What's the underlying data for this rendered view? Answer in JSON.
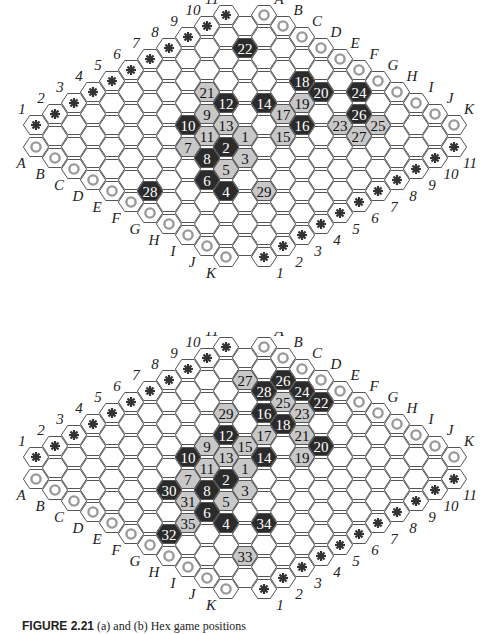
{
  "colors": {
    "dark_stone": "#2b2b2b",
    "light_stone": "#c8c8c8",
    "grid_line": "#555555",
    "circle_marker": "#999999",
    "asterisk": "#333333"
  },
  "board": {
    "size": 11,
    "letters": [
      "A",
      "B",
      "C",
      "D",
      "E",
      "F",
      "G",
      "H",
      "I",
      "J",
      "K"
    ],
    "numbers": [
      "1",
      "2",
      "3",
      "4",
      "5",
      "6",
      "7",
      "8",
      "9",
      "10",
      "11"
    ]
  },
  "boards": [
    {
      "id": "top",
      "offset_y": 0,
      "stones": [
        {
          "n": "1",
          "cell": "F6",
          "color": "light"
        },
        {
          "n": "2",
          "cell": "F5",
          "color": "dark"
        },
        {
          "n": "3",
          "cell": "G5",
          "color": "light"
        },
        {
          "n": "4",
          "cell": "H3",
          "color": "dark"
        },
        {
          "n": "5",
          "cell": "G4",
          "color": "light"
        },
        {
          "n": "6",
          "cell": "G3",
          "color": "dark"
        },
        {
          "n": "7",
          "cell": "E4",
          "color": "light"
        },
        {
          "n": "8",
          "cell": "F4",
          "color": "dark"
        },
        {
          "n": "9",
          "cell": "D6",
          "color": "light"
        },
        {
          "n": "10",
          "cell": "D5",
          "color": "dark"
        },
        {
          "n": "11",
          "cell": "E5",
          "color": "light"
        },
        {
          "n": "12",
          "cell": "D7",
          "color": "dark"
        },
        {
          "n": "13",
          "cell": "E6",
          "color": "light"
        },
        {
          "n": "14",
          "cell": "E8",
          "color": "dark"
        },
        {
          "n": "15",
          "cell": "G7",
          "color": "light"
        },
        {
          "n": "16",
          "cell": "G8",
          "color": "dark"
        },
        {
          "n": "17",
          "cell": "F8",
          "color": "light"
        },
        {
          "n": "18",
          "cell": "E10",
          "color": "dark"
        },
        {
          "n": "19",
          "cell": "F9",
          "color": "light"
        },
        {
          "n": "20",
          "cell": "F10",
          "color": "dark"
        },
        {
          "n": "21",
          "cell": "C7",
          "color": "light"
        },
        {
          "n": "22",
          "cell": "B10",
          "color": "dark"
        },
        {
          "n": "23",
          "cell": "H9",
          "color": "light"
        },
        {
          "n": "24",
          "cell": "G11",
          "color": "dark"
        },
        {
          "n": "25",
          "cell": "I10",
          "color": "light"
        },
        {
          "n": "26",
          "cell": "H10",
          "color": "dark"
        },
        {
          "n": "27",
          "cell": "I9",
          "color": "light"
        },
        {
          "n": "28",
          "cell": "F1",
          "color": "dark"
        },
        {
          "n": "29",
          "cell": "I4",
          "color": "light"
        }
      ]
    },
    {
      "id": "bottom",
      "offset_y": 332,
      "stones": [
        {
          "n": "1",
          "cell": "F6",
          "color": "light"
        },
        {
          "n": "2",
          "cell": "F5",
          "color": "dark"
        },
        {
          "n": "3",
          "cell": "G5",
          "color": "light"
        },
        {
          "n": "4",
          "cell": "H3",
          "color": "dark"
        },
        {
          "n": "5",
          "cell": "G4",
          "color": "light"
        },
        {
          "n": "6",
          "cell": "G3",
          "color": "dark"
        },
        {
          "n": "7",
          "cell": "E4",
          "color": "light"
        },
        {
          "n": "8",
          "cell": "F4",
          "color": "dark"
        },
        {
          "n": "9",
          "cell": "D6",
          "color": "light"
        },
        {
          "n": "10",
          "cell": "D5",
          "color": "dark"
        },
        {
          "n": "11",
          "cell": "E5",
          "color": "light"
        },
        {
          "n": "12",
          "cell": "D7",
          "color": "dark"
        },
        {
          "n": "13",
          "cell": "E6",
          "color": "light"
        },
        {
          "n": "14",
          "cell": "F7",
          "color": "dark"
        },
        {
          "n": "15",
          "cell": "E7",
          "color": "light"
        },
        {
          "n": "16",
          "cell": "D9",
          "color": "dark"
        },
        {
          "n": "17",
          "cell": "E8",
          "color": "light"
        },
        {
          "n": "18",
          "cell": "E9",
          "color": "dark"
        },
        {
          "n": "19",
          "cell": "G8",
          "color": "light"
        },
        {
          "n": "20",
          "cell": "G9",
          "color": "dark"
        },
        {
          "n": "21",
          "cell": "F9",
          "color": "light"
        },
        {
          "n": "22",
          "cell": "E11",
          "color": "dark"
        },
        {
          "n": "23",
          "cell": "E10",
          "color": "light"
        },
        {
          "n": "24",
          "cell": "D11",
          "color": "dark"
        },
        {
          "n": "25",
          "cell": "D10",
          "color": "light"
        },
        {
          "n": "26",
          "cell": "C11",
          "color": "dark"
        },
        {
          "n": "27",
          "cell": "B10",
          "color": "light"
        },
        {
          "n": "28",
          "cell": "C10",
          "color": "dark"
        },
        {
          "n": "29",
          "cell": "C8",
          "color": "light"
        },
        {
          "n": "30",
          "cell": "E3",
          "color": "dark"
        },
        {
          "n": "31",
          "cell": "F3",
          "color": "light"
        },
        {
          "n": "32",
          "cell": "G1",
          "color": "dark"
        },
        {
          "n": "33",
          "cell": "J2",
          "color": "light"
        },
        {
          "n": "34",
          "cell": "I4",
          "color": "dark"
        },
        {
          "n": "35",
          "cell": "G2",
          "color": "light"
        }
      ]
    }
  ],
  "caption": {
    "label": "FIGURE 2.21",
    "text": "(a) and (b) Hex game positions"
  }
}
